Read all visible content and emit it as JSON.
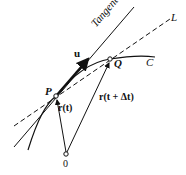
{
  "diagram": {
    "labels": {
      "tangent": "Tangent",
      "line_L": "L",
      "curve_C": "C",
      "point_P": "P",
      "point_Q": "Q",
      "origin": "0",
      "unit_vector": "u",
      "r_t": "r(t)",
      "r_t_dt": "r(t + Δt)"
    },
    "colors": {
      "ink": "#111111",
      "background": "#ffffff"
    }
  }
}
